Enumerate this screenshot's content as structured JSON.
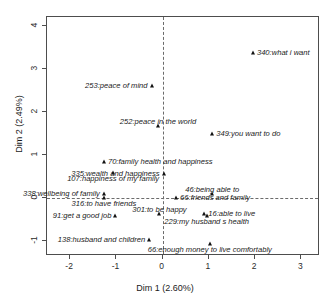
{
  "chart_data": {
    "type": "scatter",
    "title": "",
    "xlabel": "Dim 1 (2.60%)",
    "ylabel": "Dim 2 (2.49%)",
    "xlim": [
      -2.5,
      3.4
    ],
    "ylim": [
      -1.35,
      4.2
    ],
    "xticks": [
      "-2",
      "-1",
      "0",
      "1",
      "2",
      "3"
    ],
    "xtick_values": [
      -2,
      -1,
      0,
      1,
      2,
      3
    ],
    "yticks": [
      "-1",
      "0",
      "1",
      "2",
      "3",
      "4"
    ],
    "ytick_values": [
      -1,
      0,
      1,
      2,
      3,
      4
    ],
    "grid": false,
    "legend": "none",
    "reference_lines": {
      "x": 0,
      "y": 0,
      "style": "dashed"
    },
    "marker": "triangle",
    "marker_color": "#111111",
    "points": [
      {
        "id": "340",
        "label": "340:what i want",
        "x": 1.95,
        "y": 3.37,
        "label_pos": "right"
      },
      {
        "id": "253",
        "label": "253:peace of mind",
        "x": -0.24,
        "y": 2.6,
        "label_pos": "left"
      },
      {
        "id": "252",
        "label": "252:peace in the world",
        "x": -0.1,
        "y": 1.67,
        "label_pos": "above"
      },
      {
        "id": "349",
        "label": "349:you want to do",
        "x": 1.07,
        "y": 1.48,
        "label_pos": "right"
      },
      {
        "id": "70",
        "label": "70:family health and happiness",
        "x": -1.27,
        "y": 0.83,
        "label_pos": "right"
      },
      {
        "id": "107",
        "label": "107:happiness of my family",
        "x": -1.07,
        "y": 0.58,
        "label_pos": "below"
      },
      {
        "id": "335",
        "label": "335:wealth and happiness",
        "x": 0.02,
        "y": 0.56,
        "label_pos": "left"
      },
      {
        "id": "338",
        "label": "338:wellbeing of family",
        "x": -1.27,
        "y": 0.08,
        "label_pos": "left"
      },
      {
        "id": "46",
        "label": "46:being able to",
        "x": 1.07,
        "y": 0.09,
        "label_pos": "above"
      },
      {
        "id": "316",
        "label": "316:to have friends",
        "x": -1.27,
        "y": 0.0,
        "label_pos": "below"
      },
      {
        "id": "66f",
        "label": "66:friends and family",
        "x": 0.29,
        "y": 0.0,
        "label_pos": "right"
      },
      {
        "id": "91",
        "label": "91:get a good job",
        "x": -1.02,
        "y": -0.42,
        "label_pos": "left"
      },
      {
        "id": "301",
        "label": "301:to be happy",
        "x": -0.07,
        "y": -0.37,
        "label_pos": "above"
      },
      {
        "id": "229",
        "label": "229:my husband s health",
        "x": 0.95,
        "y": -0.42,
        "label_pos": "below"
      },
      {
        "id": "16",
        "label": "16:able to live",
        "x": 0.9,
        "y": -0.37,
        "label_pos": "right"
      },
      {
        "id": "138",
        "label": "138:husband and children",
        "x": -0.29,
        "y": -0.98,
        "label_pos": "left"
      },
      {
        "id": "66e",
        "label": "66:enough money to live comfortably",
        "x": 1.02,
        "y": -1.07,
        "label_pos": "below"
      }
    ]
  }
}
